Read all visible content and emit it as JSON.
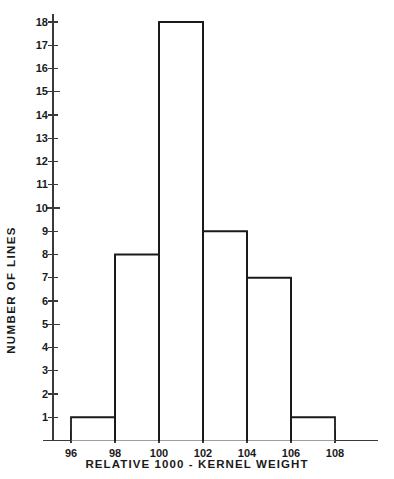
{
  "chart_data": {
    "type": "bar",
    "title": "",
    "subtitle": "",
    "xlabel": "RELATIVE  1000 - KERNEL  WEIGHT",
    "ylabel": "NUMBER  OF  LINES",
    "bin_edges": [
      96,
      98,
      100,
      102,
      104,
      106,
      108
    ],
    "categories": [
      "96-98",
      "98-100",
      "100-102",
      "102-104",
      "104-106",
      "106-108"
    ],
    "values": [
      1,
      8,
      18,
      9,
      7,
      1
    ],
    "xticks": [
      96,
      98,
      100,
      102,
      104,
      106,
      108
    ],
    "xtick_labels": [
      "96",
      "98",
      "100",
      "102",
      "104",
      "106",
      "108"
    ],
    "yticks": [
      1,
      2,
      3,
      4,
      5,
      6,
      7,
      8,
      9,
      10,
      11,
      12,
      13,
      14,
      15,
      16,
      17,
      18
    ],
    "ytick_labels": [
      "1",
      "2",
      "3",
      "4",
      "5",
      "6",
      "7",
      "8",
      "9",
      "10",
      "11",
      "12",
      "13",
      "14",
      "15",
      "16",
      "17",
      "18"
    ],
    "xlim": [
      95,
      110
    ],
    "ylim": [
      0,
      18
    ],
    "grid": false,
    "legend": false,
    "legend_position": "none",
    "bar_fill": "#ffffff",
    "bar_edge_color": "#1a1a1a",
    "axis_color": "#3a3a3a",
    "background": "#ffffff"
  },
  "axes": {
    "y_title": "NUMBER  OF  LINES",
    "x_title": "RELATIVE  1000 - KERNEL  WEIGHT"
  }
}
